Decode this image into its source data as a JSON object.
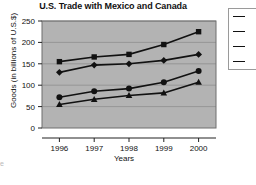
{
  "chart_data": {
    "type": "line",
    "title": "U.S. Trade with Mexico and Canada",
    "xlabel": "Years",
    "ylabel": "Goods (in billions of U.S.$)",
    "categories": [
      "1996",
      "1997",
      "1998",
      "1999",
      "2000"
    ],
    "x": [
      1996,
      1997,
      1998,
      1999,
      2000
    ],
    "ylim": [
      0,
      250
    ],
    "yticks": [
      0,
      50,
      100,
      150,
      200,
      250
    ],
    "ytick_labels": [
      "0",
      "50",
      "100",
      "150",
      "200",
      "250"
    ],
    "grid": true,
    "grid_axis": "y",
    "legend_position": "right",
    "plot_background": "#b3b3b3",
    "line_color": "#111111",
    "series": [
      {
        "name": "Series 1",
        "marker": "square",
        "values": [
          155,
          166,
          172,
          195,
          225
        ]
      },
      {
        "name": "Series 2",
        "marker": "diamond",
        "values": [
          130,
          147,
          150,
          158,
          172
        ]
      },
      {
        "name": "Series 3",
        "marker": "circle",
        "values": [
          72,
          86,
          92,
          107,
          133
        ]
      },
      {
        "name": "Series 4",
        "marker": "triangle",
        "values": [
          55,
          67,
          76,
          82,
          107
        ]
      }
    ]
  },
  "legend": {
    "items": [
      {
        "marker": "square",
        "label": ""
      },
      {
        "marker": "diamond",
        "label": ""
      },
      {
        "marker": "circle",
        "label": ""
      },
      {
        "marker": "triangle",
        "label": ""
      }
    ]
  },
  "artifacts": {
    "left_edge_fragment": "e"
  }
}
